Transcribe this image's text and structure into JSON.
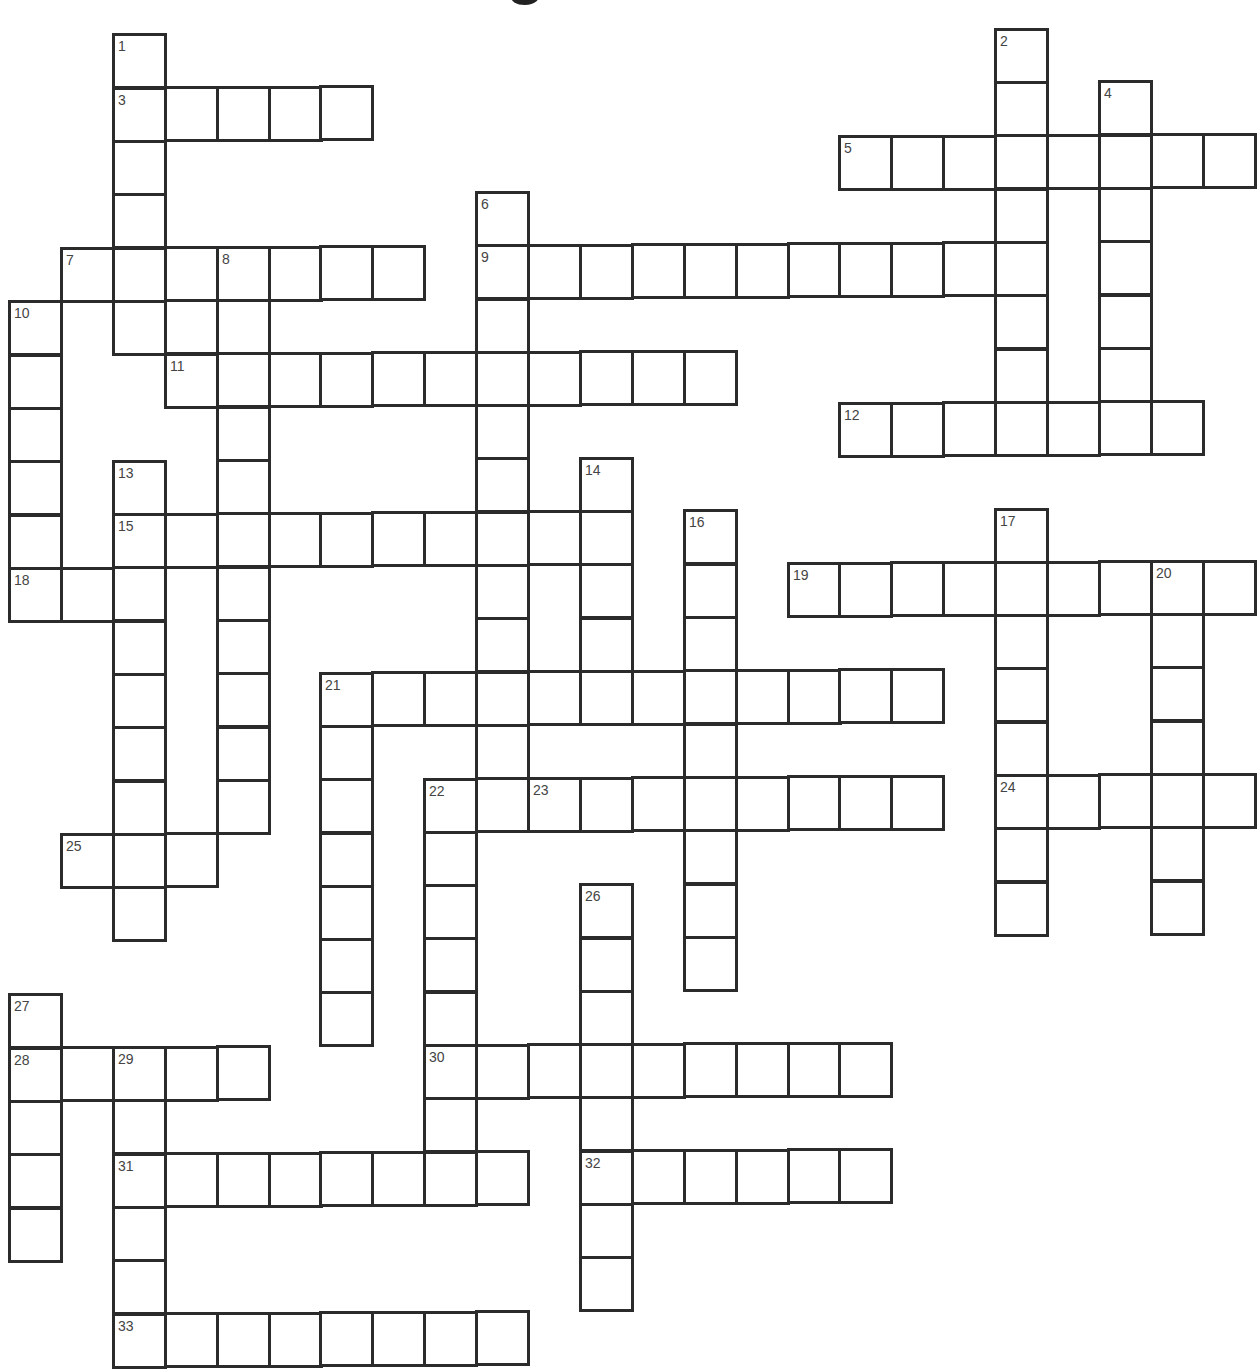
{
  "puzzle": {
    "title_fragment": "g",
    "geometry": {
      "origin_x": 8,
      "origin_y": 34,
      "col_pitch": 51.9,
      "row_pitch": 53.3,
      "cell_w": 55,
      "cell_h": 56,
      "skew_per_px": -0.0062
    },
    "across": [
      {
        "number": 3,
        "row": 1,
        "col": 2,
        "length": 5
      },
      {
        "number": 5,
        "row": 2,
        "col": 16,
        "length": 8
      },
      {
        "number": 7,
        "row": 4,
        "col": 1,
        "length": 7
      },
      {
        "number": 9,
        "row": 4,
        "col": 9,
        "length": 11
      },
      {
        "number": 11,
        "row": 6,
        "col": 3,
        "length": 11
      },
      {
        "number": 12,
        "row": 7,
        "col": 16,
        "length": 7
      },
      {
        "number": 15,
        "row": 9,
        "col": 2,
        "length": 10
      },
      {
        "number": 18,
        "row": 10,
        "col": 0,
        "length": 3
      },
      {
        "number": 19,
        "row": 10,
        "col": 15,
        "length": 9
      },
      {
        "number": 21,
        "row": 12,
        "col": 6,
        "length": 12
      },
      {
        "number": 23,
        "row": 14,
        "col": 10,
        "length": 8
      },
      {
        "number": 24,
        "row": 14,
        "col": 19,
        "length": 5
      },
      {
        "number": 25,
        "row": 15,
        "col": 1,
        "length": 3
      },
      {
        "number": 28,
        "row": 19,
        "col": 0,
        "length": 5
      },
      {
        "number": 30,
        "row": 19,
        "col": 8,
        "length": 9
      },
      {
        "number": 31,
        "row": 21,
        "col": 2,
        "length": 8
      },
      {
        "number": 32,
        "row": 21,
        "col": 11,
        "length": 6
      },
      {
        "number": 33,
        "row": 24,
        "col": 2,
        "length": 8
      }
    ],
    "down": [
      {
        "number": 1,
        "row": 0,
        "col": 2,
        "length": 6
      },
      {
        "number": 2,
        "row": 0,
        "col": 19,
        "length": 8
      },
      {
        "number": 4,
        "row": 1,
        "col": 21,
        "length": 7
      },
      {
        "number": 6,
        "row": 3,
        "col": 9,
        "length": 12
      },
      {
        "number": 8,
        "row": 4,
        "col": 4,
        "length": 11
      },
      {
        "number": 10,
        "row": 5,
        "col": 0,
        "length": 6
      },
      {
        "number": 13,
        "row": 8,
        "col": 2,
        "length": 9
      },
      {
        "number": 14,
        "row": 8,
        "col": 11,
        "length": 5
      },
      {
        "number": 16,
        "row": 9,
        "col": 13,
        "length": 9
      },
      {
        "number": 17,
        "row": 9,
        "col": 19,
        "length": 8
      },
      {
        "number": 20,
        "row": 10,
        "col": 22,
        "length": 7
      },
      {
        "number": 21,
        "row": 12,
        "col": 6,
        "length": 7
      },
      {
        "number": 22,
        "row": 14,
        "col": 8,
        "length": 8
      },
      {
        "number": 26,
        "row": 16,
        "col": 11,
        "length": 8
      },
      {
        "number": 27,
        "row": 18,
        "col": 0,
        "length": 5
      },
      {
        "number": 29,
        "row": 19,
        "col": 2,
        "length": 6
      }
    ],
    "extra_cells": [
      {
        "row": 5,
        "col": 3
      }
    ],
    "cell_values": {}
  }
}
